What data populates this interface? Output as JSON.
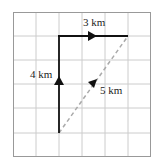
{
  "diagram": {
    "type": "displacement-grid",
    "grid": {
      "cols": 6,
      "rows": 6,
      "line_color": "#c8c8c8",
      "border_color": "#9a9a9a"
    },
    "paths": [
      {
        "name": "north-leg",
        "label": "4 km",
        "from": [
          2,
          5
        ],
        "to": [
          2,
          1
        ],
        "style": "solid",
        "color": "#111111"
      },
      {
        "name": "east-leg",
        "label": "3 km",
        "from": [
          2,
          1
        ],
        "to": [
          5,
          1
        ],
        "style": "solid",
        "color": "#111111"
      },
      {
        "name": "resultant",
        "label": "5 km",
        "from": [
          2,
          5
        ],
        "to": [
          5,
          1
        ],
        "style": "dashed",
        "color": "#aaaaaa"
      }
    ],
    "labels": {
      "north": "4 km",
      "east": "3 km",
      "resultant": "5 km"
    }
  }
}
